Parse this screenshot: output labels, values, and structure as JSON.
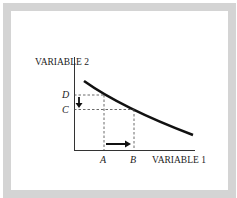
{
  "diagram": {
    "y_axis_label": "VARIABLE 2",
    "x_axis_label": "VARIABLE 1",
    "y_ticks": [
      {
        "label": "D"
      },
      {
        "label": "C"
      }
    ],
    "x_ticks": [
      {
        "label": "A"
      },
      {
        "label": "B"
      }
    ],
    "curve": "downward-sloping convex curve",
    "annotations": [
      "movement from A to B on x-axis (right arrow)",
      "movement from D to C on y-axis (down arrow)"
    ],
    "colors": {
      "frame": "#d4d4d4",
      "ink": "#222222"
    }
  }
}
